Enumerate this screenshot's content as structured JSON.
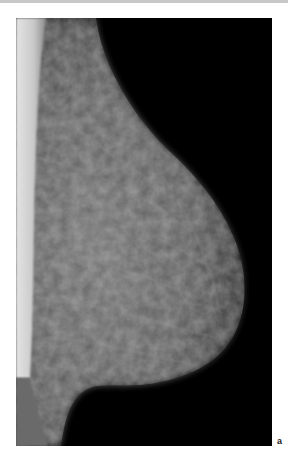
{
  "figure": {
    "panel_label": "a",
    "colors": {
      "background": "#000000",
      "tissue": "#5a5a5a",
      "pectoral": "#d8d8d8",
      "page": "#ffffff"
    }
  }
}
